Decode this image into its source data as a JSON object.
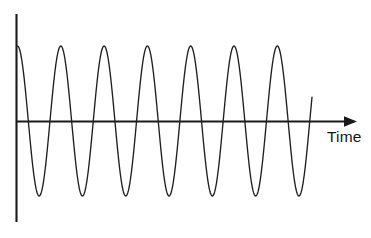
{
  "figure": {
    "title": "",
    "background_color": "#ffffff",
    "width": 371,
    "height": 238
  },
  "axes": {
    "time_axis_label": "Time",
    "time_axis_label_color": "#141414",
    "axis_color": "#1a1a1a",
    "vertical_axis_label": "",
    "arrow_icon_name": "right-arrow-head"
  },
  "waveform": {
    "color": "#1f1f1f",
    "line_width": 1.35,
    "description": "continuous sinusoidal oscillation"
  },
  "chart_data": {
    "type": "line",
    "title": "",
    "xlabel": "Time",
    "ylabel": "",
    "grid": false,
    "legend": null,
    "annotations": [],
    "axis_origin_px": {
      "x": 16,
      "y": 121
    },
    "axis_x_end_px": 357,
    "axis_y_top_px": 14,
    "axis_y_bottom_px": 222,
    "waveform_geometry": {
      "form": "cosine",
      "amplitude_px": 75,
      "period_px": 43.3,
      "cycles": 6.8,
      "baseline_y_px": 121,
      "peak_y_px": 46,
      "trough_y_px": 196,
      "start_x_px": 17.5,
      "end_x_px": 312,
      "start_phase": "peak",
      "damping": 0
    },
    "x": [
      0,
      0.25,
      0.5,
      0.75,
      1,
      1.25,
      1.5,
      1.75,
      2,
      2.25,
      2.5,
      2.75,
      3,
      3.25,
      3.5,
      3.75,
      4,
      4.25,
      4.5,
      4.75,
      5,
      5.25,
      5.5,
      5.75,
      6,
      6.25,
      6.5,
      6.75
    ],
    "y": [
      1,
      0,
      -1,
      0,
      1,
      0,
      -1,
      0,
      1,
      0,
      -1,
      0,
      1,
      0,
      -1,
      0,
      1,
      0,
      -1,
      0,
      1,
      0,
      -1,
      0,
      1,
      0,
      -1,
      0
    ],
    "xlim": [
      0,
      7.87
    ],
    "ylim": [
      -1.43,
      1.43
    ],
    "series": [
      {
        "name": "oscillation",
        "peaks_x_px": [
          17.5,
          60.8,
          104.1,
          147.4,
          190.7,
          234.0,
          277.3
        ],
        "troughs_x_px": [
          39.2,
          82.5,
          125.8,
          169.1,
          212.4,
          255.7,
          299.0
        ],
        "peak_value": 1,
        "trough_value": -1
      }
    ]
  }
}
